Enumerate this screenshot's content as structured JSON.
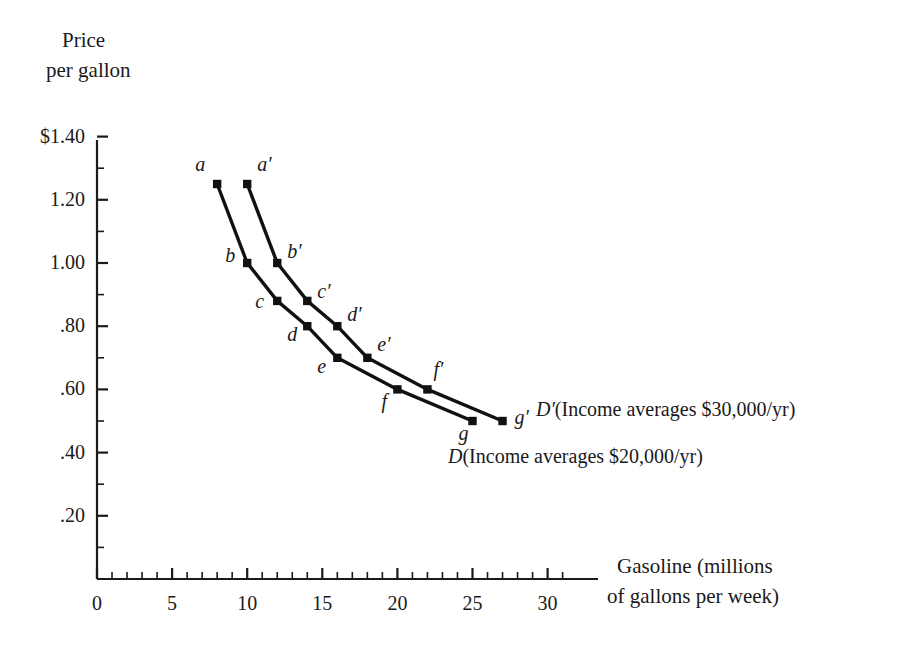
{
  "chart_data": {
    "type": "line",
    "title": "",
    "ylabel": "Price per gallon",
    "ylabel_line1": "Price",
    "ylabel_line2": "per gallon",
    "xlabel": "Gasoline (millions of gallons per week)",
    "xlabel_line1": "Gasoline (millions",
    "xlabel_line2": "of gallons per week)",
    "xlim": [
      0,
      31
    ],
    "ylim": [
      0,
      1.5
    ],
    "grid": false,
    "legend_position": "inline-right",
    "x_ticks": [
      0,
      5,
      10,
      15,
      20,
      25,
      30
    ],
    "x_tick_labels": [
      "0",
      "5",
      "10",
      "15",
      "20",
      "25",
      "30"
    ],
    "x_minor_step": 1,
    "y_ticks": [
      0.2,
      0.4,
      0.6,
      0.8,
      1.0,
      1.2,
      1.4
    ],
    "y_tick_labels": [
      ".20",
      ".40",
      ".60",
      ".80",
      "1.00",
      "1.20",
      "$1.40"
    ],
    "y_minor_step": 0.1,
    "series": [
      {
        "name": "D",
        "legend": "D(Income averages $20,000/yr)",
        "legend_symbol": "D",
        "legend_text": "(Income averages $20,000/yr)",
        "point_labels": [
          "a",
          "b",
          "c",
          "d",
          "e",
          "f",
          "g"
        ],
        "x": [
          8,
          10,
          12,
          14,
          16,
          20,
          25
        ],
        "values": [
          1.25,
          1.0,
          0.88,
          0.8,
          0.7,
          0.6,
          0.5
        ]
      },
      {
        "name": "D'",
        "legend": "D′(Income averages $30,000/yr)",
        "legend_symbol": "D′",
        "legend_text": "(Income averages $30,000/yr)",
        "point_labels": [
          "a′",
          "b′",
          "c′",
          "d′",
          "e′",
          "f′",
          "g′"
        ],
        "x": [
          10,
          12,
          14,
          16,
          18,
          22,
          27
        ],
        "values": [
          1.25,
          1.0,
          0.88,
          0.8,
          0.7,
          0.6,
          0.5
        ]
      }
    ],
    "colors": {
      "line": "#111111",
      "axis": "#1a1a1a",
      "background": "#ffffff",
      "text": "#1a1a1a"
    }
  }
}
